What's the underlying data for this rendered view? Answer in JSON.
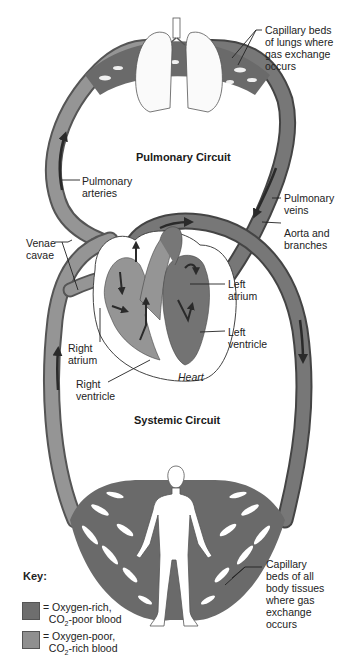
{
  "diagram": {
    "circuits": {
      "pulmonary": "Pulmonary Circuit",
      "systemic": "Systemic Circuit"
    },
    "labels": {
      "capillary_lungs": [
        "Capillary beds",
        "of lungs where",
        "gas exchange",
        "occurs"
      ],
      "pulmonary_arteries": [
        "Pulmonary",
        "arteries"
      ],
      "pulmonary_veins": [
        "Pulmonary",
        "veins"
      ],
      "aorta": [
        "Aorta and",
        "branches"
      ],
      "venae_cavae": [
        "Venae",
        "cavae"
      ],
      "left_atrium": [
        "Left",
        "atrium"
      ],
      "left_ventricle": [
        "Left",
        "ventricle"
      ],
      "right_atrium": [
        "Right",
        "atrium"
      ],
      "right_ventricle": [
        "Right",
        "ventricle"
      ],
      "heart": "Heart",
      "capillary_body": [
        "Capillary",
        "beds of all",
        "body tissues",
        "where gas",
        "exchange",
        "occurs"
      ]
    },
    "key": {
      "title": "Key:",
      "items": [
        {
          "line1": "= Oxygen-rich,",
          "line2_pre": "CO",
          "line2_sub": "2",
          "line2_post": "-poor blood",
          "color": "#6e6e6e"
        },
        {
          "line1": "= Oxygen-poor,",
          "line2_pre": "CO",
          "line2_sub": "2",
          "line2_post": "-rich blood",
          "color": "#8f8f8f"
        }
      ]
    },
    "colors": {
      "oxygen_rich": "#6e6e6e",
      "oxygen_poor": "#8f8f8f",
      "vessel_edge": "#4a4a4a",
      "arrow": "#2a2a2a",
      "background": "#ffffff"
    }
  }
}
